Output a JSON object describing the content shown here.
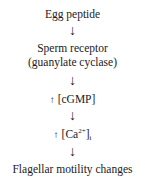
{
  "diagram": {
    "type": "pathway",
    "nodes": [
      {
        "id": "egg_peptide",
        "label": "Egg peptide"
      },
      {
        "id": "sperm_receptor",
        "label": "Sperm receptor",
        "sublabel": "(guanylate cyclase)"
      },
      {
        "id": "cgmp",
        "prefix_icon": "up-arrow",
        "label": "[cGMP]"
      },
      {
        "id": "calcium",
        "prefix_icon": "up-arrow",
        "label_main": "[Ca",
        "superscript": "2+",
        "label_close": "]",
        "subscript": "i"
      },
      {
        "id": "motility",
        "label": "Flagellar motility changes"
      }
    ],
    "edges": [
      {
        "from": "egg_peptide",
        "to": "sperm_receptor"
      },
      {
        "from": "sperm_receptor",
        "to": "cgmp"
      },
      {
        "from": "cgmp",
        "to": "calcium"
      },
      {
        "from": "calcium",
        "to": "motility"
      }
    ],
    "arrow_glyph": "↓",
    "up_glyph": "↑"
  }
}
